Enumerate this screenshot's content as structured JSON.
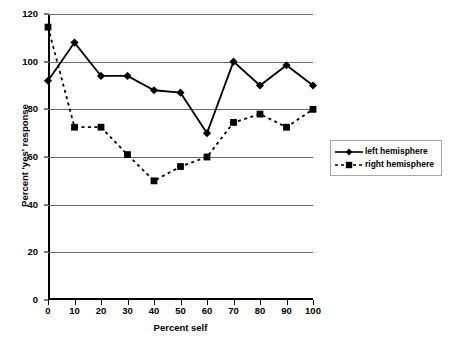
{
  "chart_data": {
    "type": "line",
    "title": "",
    "xlabel": "Percent self",
    "ylabel": "Percent 'yes' response",
    "x": [
      0,
      10,
      20,
      30,
      40,
      50,
      60,
      70,
      80,
      90,
      100
    ],
    "xlim": [
      0,
      100
    ],
    "ylim": [
      0,
      120
    ],
    "xticks": [
      "0",
      "10",
      "20",
      "30",
      "40",
      "50",
      "60",
      "70",
      "80",
      "90",
      "100"
    ],
    "yticks": [
      "0",
      "20",
      "40",
      "60",
      "80",
      "100",
      "120"
    ],
    "grid": "horizontal",
    "legend_position": "right",
    "series": [
      {
        "name": "left hemisphere",
        "marker": "diamond",
        "linestyle": "solid",
        "color": "#000000",
        "values": [
          92,
          108,
          94,
          94,
          88,
          87,
          70,
          100,
          90,
          98.5,
          90
        ]
      },
      {
        "name": "right hemisphere",
        "marker": "square",
        "linestyle": "dashed",
        "color": "#000000",
        "values": [
          114.5,
          72.5,
          72.5,
          61,
          50,
          56,
          60,
          74.5,
          78,
          72.5,
          80
        ]
      }
    ]
  },
  "legend": {
    "entries": [
      {
        "label": "left hemisphere"
      },
      {
        "label": "right hemisphere"
      }
    ]
  }
}
